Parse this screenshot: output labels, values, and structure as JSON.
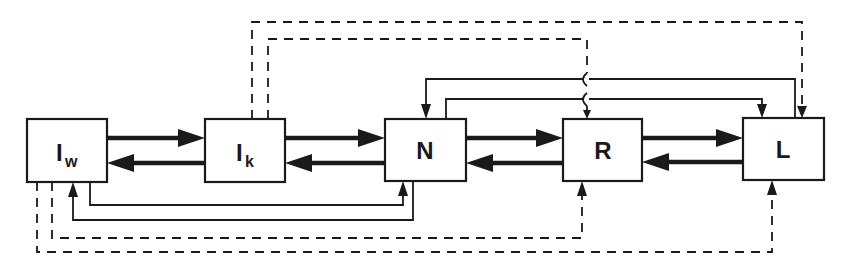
{
  "diagram": {
    "type": "block-flow",
    "colors": {
      "stroke": "#1a1a1a",
      "background": "#ffffff"
    },
    "nodes": [
      {
        "id": "Iw",
        "label": "I",
        "subscript": "w",
        "x": 27,
        "y": 119,
        "w": 80,
        "h": 63
      },
      {
        "id": "Ik",
        "label": "I",
        "subscript": "k",
        "x": 205,
        "y": 119,
        "w": 80,
        "h": 63
      },
      {
        "id": "N",
        "label": "N",
        "subscript": "",
        "x": 385,
        "y": 119,
        "w": 81,
        "h": 62
      },
      {
        "id": "R",
        "label": "R",
        "subscript": "",
        "x": 563,
        "y": 119,
        "w": 79,
        "h": 62
      },
      {
        "id": "L",
        "label": "L",
        "subscript": "",
        "x": 743,
        "y": 118,
        "w": 81,
        "h": 62
      }
    ],
    "edges": [
      {
        "from": "Iw",
        "to": "Ik",
        "style": "thick"
      },
      {
        "from": "Ik",
        "to": "Iw",
        "style": "thick"
      },
      {
        "from": "Ik",
        "to": "N",
        "style": "thick"
      },
      {
        "from": "N",
        "to": "Ik",
        "style": "thick"
      },
      {
        "from": "N",
        "to": "R",
        "style": "thick"
      },
      {
        "from": "R",
        "to": "N",
        "style": "thick"
      },
      {
        "from": "R",
        "to": "L",
        "style": "thick"
      },
      {
        "from": "L",
        "to": "R",
        "style": "thick"
      },
      {
        "from": "L",
        "to": "N",
        "style": "solid-thin",
        "route": "top"
      },
      {
        "from": "N",
        "to": "L",
        "style": "solid-thin",
        "route": "top"
      },
      {
        "from": "Iw",
        "to": "N",
        "style": "solid-thin",
        "route": "bottom"
      },
      {
        "from": "N",
        "to": "Iw",
        "style": "solid-thin",
        "route": "bottom"
      },
      {
        "from": "Ik",
        "to": "L",
        "style": "dashed",
        "route": "top"
      },
      {
        "from": "Ik",
        "to": "R",
        "style": "dashed",
        "route": "top"
      },
      {
        "from": "Iw",
        "to": "R",
        "style": "dashed",
        "route": "bottom"
      },
      {
        "from": "Iw",
        "to": "L",
        "style": "dashed",
        "route": "bottom"
      }
    ]
  }
}
